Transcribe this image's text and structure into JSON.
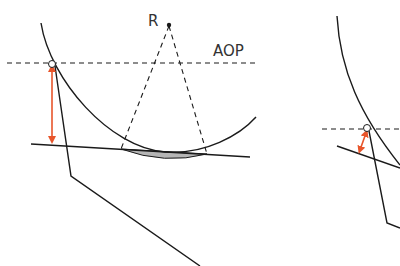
{
  "labels": {
    "center_point": "R",
    "reference_line": "AOP"
  },
  "colors": {
    "stroke": "#1a1a1a",
    "dashed": "#1a1a1a",
    "arrow": "#e8552b",
    "shade": "#b5b5b5",
    "text": "#333333"
  },
  "panels": [
    {
      "name": "left-panel",
      "description": "Large circle arc with chord, center R, AOP dashed line, vertical orange distance arrow"
    },
    {
      "name": "right-panel",
      "description": "Partial view with short orange distance arrow"
    }
  ]
}
